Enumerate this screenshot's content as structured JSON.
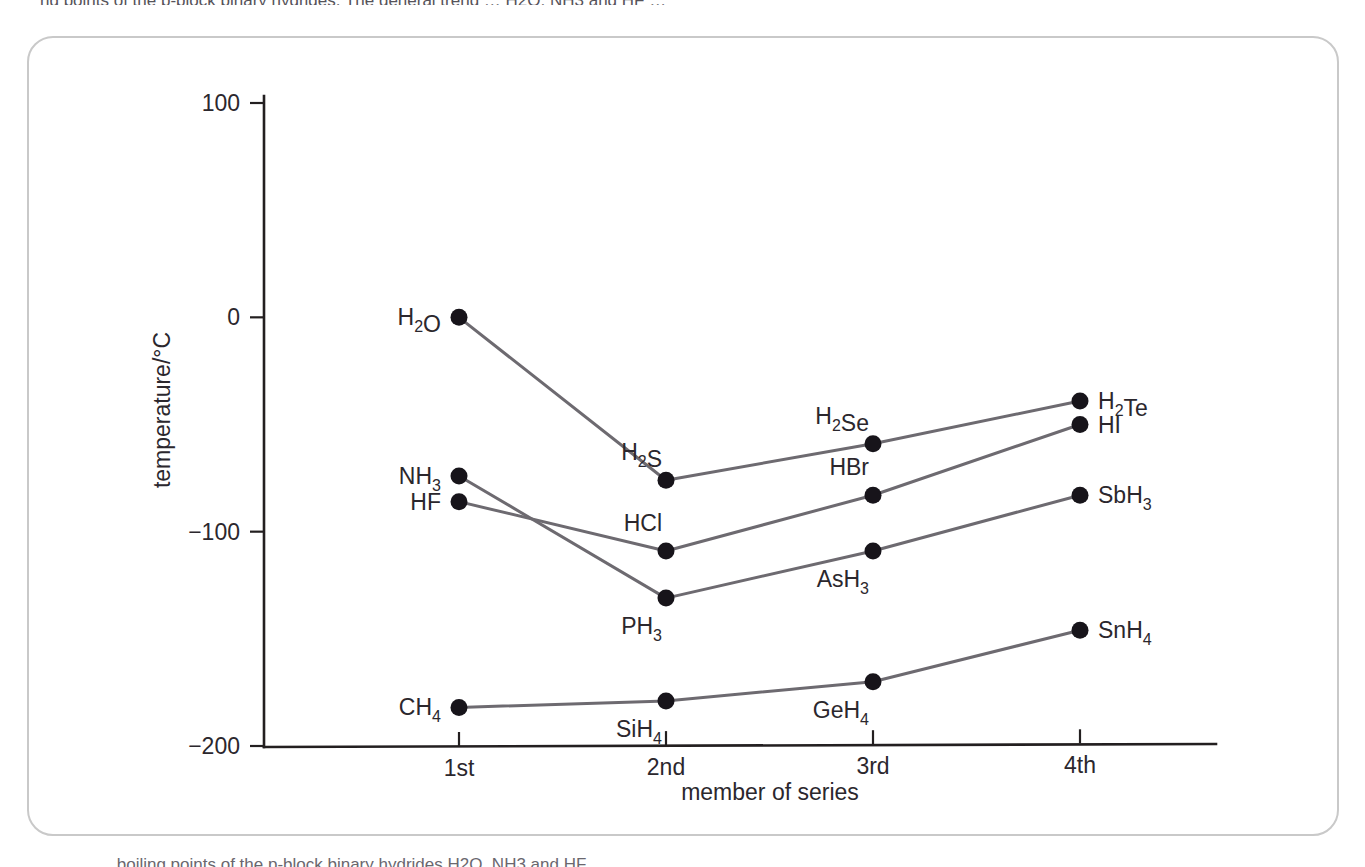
{
  "figure": {
    "top_clipped_text": "ng points of the p-block binary hydrides. The general trend … H2O, NH3 and HF …",
    "bottom_caption_clipped": "… boiling points of the p-block binary hydrides H2O, NH3 and HF."
  },
  "chart_data": {
    "type": "line",
    "title": "",
    "xlabel": "member of series",
    "ylabel": "temperature/°C",
    "categories": [
      "1st",
      "2nd",
      "3rd",
      "4th"
    ],
    "ylim": [
      -200,
      100
    ],
    "yticks": [
      100,
      0,
      -100,
      -200
    ],
    "ytick_labels": [
      "100",
      "0",
      "−100",
      "−200"
    ],
    "grid": false,
    "legend": "none (points labelled directly)",
    "series": [
      {
        "name": "group 16 hydrides",
        "labels": [
          "H2O",
          "H2S",
          "H2Se",
          "H2Te"
        ],
        "label_html": [
          "H<sub>2</sub>O",
          "H<sub>2</sub>S",
          "H<sub>2</sub>Se",
          "H<sub>2</sub>Te"
        ],
        "values": [
          0,
          -76,
          -59,
          -39
        ]
      },
      {
        "name": "group 15 hydrides",
        "labels": [
          "NH3",
          "PH3",
          "AsH3",
          "SbH3"
        ],
        "label_html": [
          "NH<sub>3</sub>",
          "PH<sub>3</sub>",
          "AsH<sub>3</sub>",
          "SbH<sub>3</sub>"
        ],
        "values": [
          -74,
          -131,
          -109,
          -83
        ]
      },
      {
        "name": "group 17 hydrides",
        "labels": [
          "HF",
          "HCl",
          "HBr",
          "HI"
        ],
        "label_html": [
          "HF",
          "HCl",
          "HBr",
          "HI"
        ],
        "values": [
          -86,
          -109,
          -83,
          -50
        ]
      },
      {
        "name": "group 14 hydrides",
        "labels": [
          "CH4",
          "SiH4",
          "GeH4",
          "SnH4"
        ],
        "label_html": [
          "CH<sub>4</sub>",
          "SiH<sub>4</sub>",
          "GeH<sub>4</sub>",
          "SnH<sub>4</sub>"
        ],
        "values": [
          -182,
          -179,
          -170,
          -146
        ]
      }
    ],
    "point_labels": [
      {
        "text": "H2O",
        "series": 0,
        "index": 0,
        "value": 0,
        "placement": "left"
      },
      {
        "text": "H2S",
        "series": 0,
        "index": 1,
        "value": -76,
        "placement": "above-left"
      },
      {
        "text": "H2Se",
        "series": 0,
        "index": 2,
        "value": -59,
        "placement": "above-left"
      },
      {
        "text": "H2Te",
        "series": 0,
        "index": 3,
        "value": -39,
        "placement": "right"
      },
      {
        "text": "NH3",
        "series": 1,
        "index": 0,
        "value": -74,
        "placement": "left"
      },
      {
        "text": "PH3",
        "series": 1,
        "index": 1,
        "value": -131,
        "placement": "below-left"
      },
      {
        "text": "AsH3",
        "series": 1,
        "index": 2,
        "value": -109,
        "placement": "below-left"
      },
      {
        "text": "SbH3",
        "series": 1,
        "index": 3,
        "value": -83,
        "placement": "right"
      },
      {
        "text": "HF",
        "series": 2,
        "index": 0,
        "value": -86,
        "placement": "left"
      },
      {
        "text": "HCl",
        "series": 2,
        "index": 1,
        "value": -109,
        "placement": "above-left"
      },
      {
        "text": "HBr",
        "series": 2,
        "index": 2,
        "value": -83,
        "placement": "above-left"
      },
      {
        "text": "HI",
        "series": 2,
        "index": 3,
        "value": -50,
        "placement": "right"
      },
      {
        "text": "CH4",
        "series": 3,
        "index": 0,
        "value": -182,
        "placement": "left"
      },
      {
        "text": "SiH4",
        "series": 3,
        "index": 1,
        "value": -179,
        "placement": "below-left"
      },
      {
        "text": "GeH4",
        "series": 3,
        "index": 2,
        "value": -170,
        "placement": "below-left"
      },
      {
        "text": "SnH4",
        "series": 3,
        "index": 3,
        "value": -146,
        "placement": "right"
      }
    ],
    "colors": {
      "line": "#6d6a70",
      "point": "#17141a",
      "axis": "#231f20",
      "text": "#2b272d",
      "frame": "#c9c9c9",
      "background": "#ffffff"
    }
  }
}
